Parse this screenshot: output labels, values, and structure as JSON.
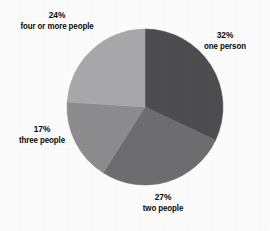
{
  "chart_data": {
    "type": "pie",
    "title": "",
    "subtitle": "",
    "xlabel": "",
    "ylabel": "",
    "legend_position": "outside-labels",
    "grid": false,
    "start_angle_deg": 0,
    "direction": "clockwise",
    "categories": [
      "one person",
      "two people",
      "three people",
      "four or more people"
    ],
    "values": [
      32,
      27,
      17,
      24
    ],
    "value_unit": "percent",
    "colors": [
      "#4e4e50",
      "#6e6e70",
      "#8d8d8f",
      "#a9a9ab"
    ],
    "slices": [
      {
        "label": "one person",
        "value": 32,
        "value_text": "32%",
        "color": "#4e4e50",
        "start_deg": 0,
        "end_deg": 115.2
      },
      {
        "label": "two people",
        "value": 27,
        "value_text": "27%",
        "color": "#6e6e70",
        "start_deg": 115.2,
        "end_deg": 212.4
      },
      {
        "label": "three people",
        "value": 17,
        "value_text": "17%",
        "color": "#8d8d8f",
        "start_deg": 212.4,
        "end_deg": 273.6
      },
      {
        "label": "four or more people",
        "value": 24,
        "value_text": "24%",
        "color": "#a9a9ab",
        "start_deg": 273.6,
        "end_deg": 360
      }
    ]
  },
  "labels": {
    "one_person": {
      "percent": "32%",
      "name": "one person"
    },
    "two_people": {
      "percent": "27%",
      "name": "two people"
    },
    "three_people": {
      "percent": "17%",
      "name": "three people"
    },
    "four_or_more": {
      "percent": "24%",
      "name": "four or more people"
    }
  },
  "geometry": {
    "center_x": 145,
    "center_y": 107,
    "radius": 78
  },
  "background_color": "#fdfdfd",
  "text_color": "#0a0a0a"
}
